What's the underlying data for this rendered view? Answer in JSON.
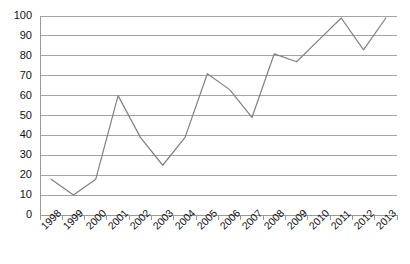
{
  "chart_data": {
    "type": "line",
    "title": "",
    "subtitle": "",
    "xlabel": "",
    "ylabel": "",
    "categories": [
      "1998",
      "1999",
      "2000",
      "2001",
      "2002",
      "2003",
      "2004",
      "2005",
      "2006",
      "2007",
      "2008",
      "2009",
      "2010",
      "2011",
      "2012",
      "2013"
    ],
    "values": [
      18,
      10,
      18,
      60,
      39,
      25,
      39,
      71,
      63,
      49,
      81,
      77,
      88,
      99,
      83,
      99
    ],
    "series": [
      {
        "name": "",
        "values": [
          18,
          10,
          18,
          60,
          39,
          25,
          39,
          71,
          63,
          49,
          81,
          77,
          88,
          99,
          83,
          99
        ]
      }
    ],
    "ylim": [
      0,
      100
    ],
    "ytick_labels": [
      "0",
      "10",
      "20",
      "30",
      "40",
      "50",
      "60",
      "70",
      "80",
      "90",
      "100"
    ],
    "ytick_values": [
      0,
      10,
      20,
      30,
      40,
      50,
      60,
      70,
      80,
      90,
      100
    ],
    "grid": {
      "horizontal": true,
      "vertical": false,
      "color": "#9a9a9a"
    },
    "legend": {
      "visible": false,
      "position": "none",
      "entries": []
    },
    "line_color": "#808080",
    "axis_color": "#9a9a9a",
    "markers": false,
    "xtick_rotation": -45,
    "annotations": []
  },
  "plot_geometry": {
    "left": 40,
    "right": 397,
    "top": 16,
    "bottom": 215
  }
}
